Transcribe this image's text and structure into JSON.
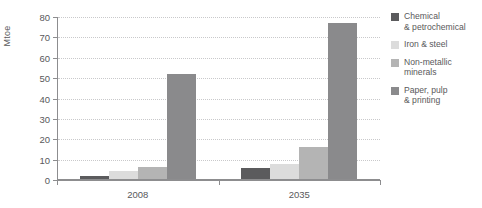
{
  "chart_data": {
    "type": "bar",
    "title": "",
    "xlabel": "",
    "ylabel": "Mtoe",
    "categories": [
      "2008",
      "2035"
    ],
    "ylim": [
      0,
      80
    ],
    "yticks": [
      0,
      10,
      20,
      30,
      40,
      50,
      60,
      70,
      80
    ],
    "ytick_labels": [
      "0",
      "10",
      "20",
      "30",
      "40",
      "50",
      "60",
      "70",
      "80"
    ],
    "grid": true,
    "legend_position": "right",
    "series": [
      {
        "name": "Chemical\n& petrochemical",
        "color": "#5b5b5d",
        "values": [
          2,
          6
        ]
      },
      {
        "name": "Iron & steel",
        "color": "#dcdcdc",
        "values": [
          4.5,
          8
        ]
      },
      {
        "name": "Non-metallic\nminerals",
        "color": "#b4b4b4",
        "values": [
          6.5,
          16
        ]
      },
      {
        "name": "Paper, pulp\n& printing",
        "color": "#8a8a8c",
        "values": [
          52,
          77
        ]
      }
    ]
  }
}
